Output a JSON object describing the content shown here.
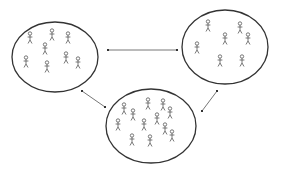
{
  "diagram": {
    "stroke_color": "#333333",
    "figure_color": "#555555",
    "background": "#ffffff",
    "groups": [
      {
        "id": "group-left",
        "cx": 55,
        "cy": 57,
        "rx": 43,
        "ry": 35,
        "figure_count": 8,
        "figures": [
          [
            30,
            37
          ],
          [
            52,
            34
          ],
          [
            68,
            37
          ],
          [
            45,
            48
          ],
          [
            26,
            61
          ],
          [
            47,
            66
          ],
          [
            66,
            57
          ],
          [
            78,
            62
          ]
        ]
      },
      {
        "id": "group-right",
        "cx": 225,
        "cy": 47,
        "rx": 43,
        "ry": 37,
        "figure_count": 7,
        "figures": [
          [
            208,
            25
          ],
          [
            225,
            38
          ],
          [
            240,
            27
          ],
          [
            248,
            38
          ],
          [
            197,
            47
          ],
          [
            220,
            60
          ],
          [
            242,
            60
          ]
        ]
      },
      {
        "id": "group-bottom",
        "cx": 151,
        "cy": 126,
        "rx": 45,
        "ry": 37,
        "figure_count": 12,
        "figures": [
          [
            124,
            108
          ],
          [
            133,
            114
          ],
          [
            148,
            103
          ],
          [
            163,
            104
          ],
          [
            170,
            112
          ],
          [
            118,
            124
          ],
          [
            144,
            124
          ],
          [
            157,
            118
          ],
          [
            165,
            128
          ],
          [
            172,
            135
          ],
          [
            132,
            139
          ],
          [
            150,
            140
          ]
        ]
      }
    ],
    "connections": [
      {
        "id": "left-right",
        "from": "group-left",
        "to": "group-right",
        "x1": 108,
        "y1": 50,
        "x2": 177,
        "y2": 50,
        "bidirectional": true
      },
      {
        "id": "left-bottom",
        "from": "group-left",
        "to": "group-bottom",
        "x1": 82,
        "y1": 91,
        "x2": 105,
        "y2": 107,
        "bidirectional": true
      },
      {
        "id": "bottom-right",
        "from": "group-bottom",
        "to": "group-right",
        "x1": 202,
        "y1": 111,
        "x2": 217,
        "y2": 91,
        "bidirectional": true
      }
    ]
  }
}
